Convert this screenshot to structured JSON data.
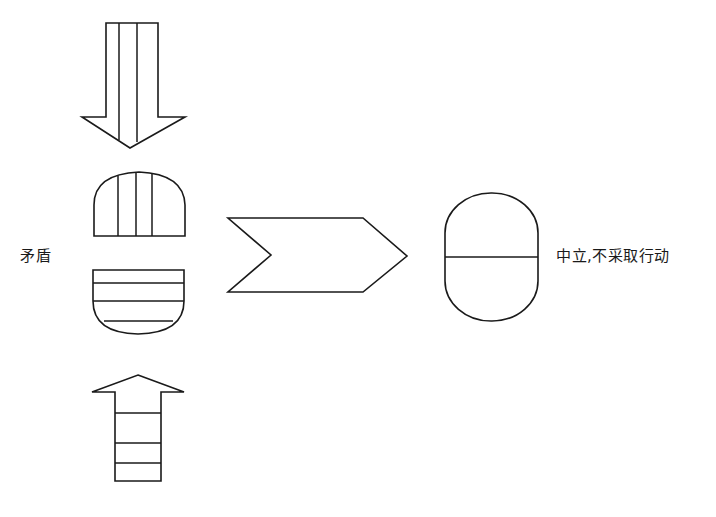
{
  "diagram": {
    "type": "decision-flow",
    "labels": {
      "left": "矛盾",
      "right": "中立,不采取行动"
    },
    "shapes": [
      {
        "id": "down-arrow",
        "description": "Downward arrow with two vertical stripes in shaft"
      },
      {
        "id": "dome",
        "description": "Half-dome shape with three vertical stripes"
      },
      {
        "id": "bowl",
        "description": "Bowl shape with horizontal stripes"
      },
      {
        "id": "up-arrow",
        "description": "Upward arrow with horizontal stripes in shaft"
      },
      {
        "id": "chevron",
        "description": "Right-pointing chevron/process arrow"
      },
      {
        "id": "capsule",
        "description": "Capsule split horizontally into two halves"
      }
    ],
    "colors": {
      "stroke": "#1a1a1a",
      "background": "#ffffff"
    }
  }
}
